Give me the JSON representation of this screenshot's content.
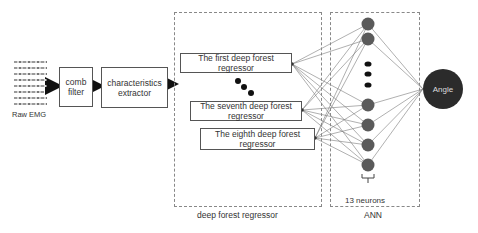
{
  "diagram": {
    "input": {
      "label": "Raw EMG"
    },
    "stages": [
      {
        "id": "comb-filter",
        "label": "comb filter"
      },
      {
        "id": "characteristics-extractor",
        "label": "characteristics extractor"
      }
    ],
    "deep_forest": {
      "group_label": "deep forest regressor",
      "regressors": [
        {
          "label": "The first deep forest regressor"
        },
        {
          "label": "The seventh deep forest regressor"
        },
        {
          "label": "The eighth deep forest regressor"
        }
      ],
      "ellipsis": "•••"
    },
    "ann": {
      "group_label": "ANN",
      "neuron_count_label": "13 neurons",
      "visible_neurons": 7
    },
    "output": {
      "label": "Angle"
    },
    "colors": {
      "neuron": "#5a5a5a",
      "output_node": "#2b2b2b",
      "edge": "#777777",
      "box_border": "#555555",
      "dashed_border": "#888888"
    }
  }
}
